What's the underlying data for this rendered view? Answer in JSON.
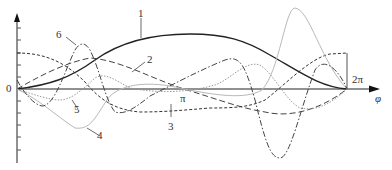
{
  "diagram": {
    "x_axis_label": "φ",
    "origin_label": "0",
    "pi_label": "π",
    "two_pi_label": "2π",
    "curve_labels": [
      "1",
      "2",
      "3",
      "4",
      "5",
      "6"
    ],
    "colors": {
      "axis": "#222222",
      "curve1": "#222222",
      "curve2": "#444444",
      "curve3": "#333333",
      "curve4": "#b0b0b0",
      "curve5": "#9a9a9a",
      "curve6": "#444444"
    }
  }
}
